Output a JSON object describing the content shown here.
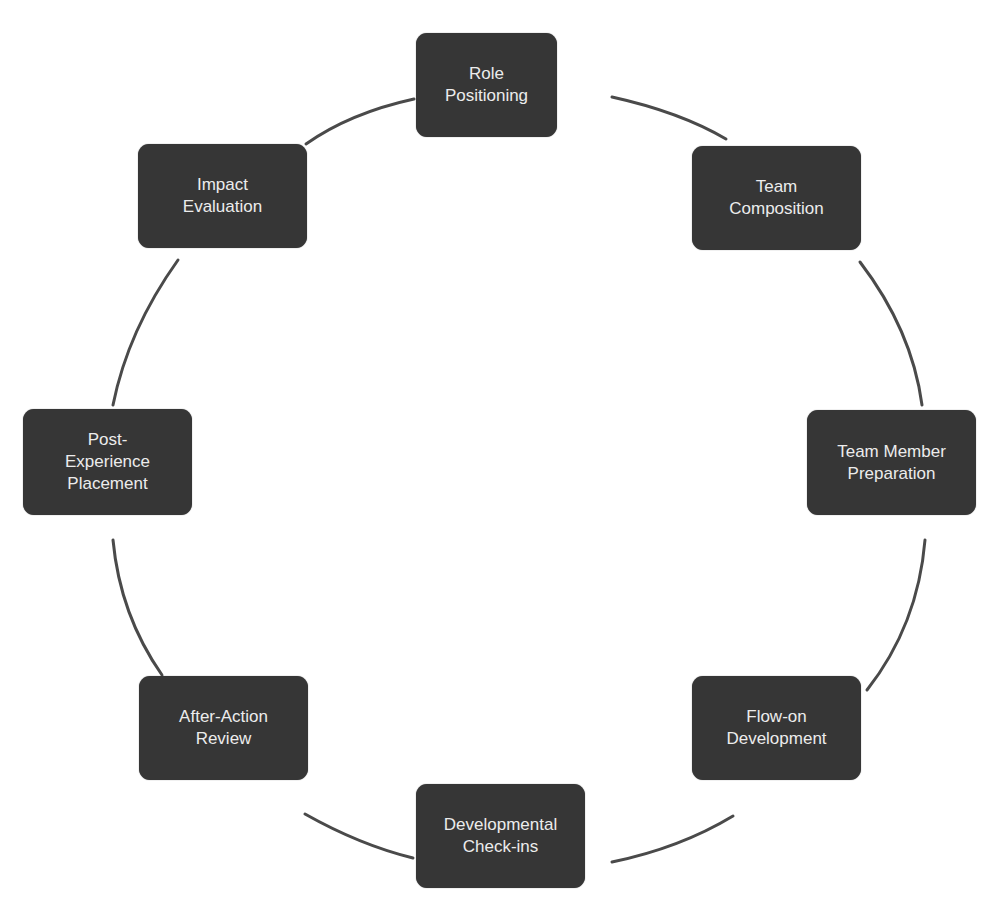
{
  "diagram": {
    "type": "cycle",
    "colors": {
      "node_fill": "#363636",
      "node_text": "#ececec",
      "connector": "#4a4a4a",
      "background": "#ffffff"
    },
    "nodes": [
      {
        "id": "role-positioning",
        "label": "Role\nPositioning"
      },
      {
        "id": "team-composition",
        "label": "Team\nComposition"
      },
      {
        "id": "team-member-preparation",
        "label": "Team Member\nPreparation"
      },
      {
        "id": "flow-on-development",
        "label": "Flow-on\nDevelopment"
      },
      {
        "id": "developmental-check-ins",
        "label": "Developmental\nCheck-ins"
      },
      {
        "id": "after-action-review",
        "label": "After-Action\nReview"
      },
      {
        "id": "post-experience-placement",
        "label": "Post-\nExperience\nPlacement"
      },
      {
        "id": "impact-evaluation",
        "label": "Impact\nEvaluation"
      }
    ],
    "connections": [
      {
        "from": "role-positioning",
        "to": "team-composition"
      },
      {
        "from": "team-composition",
        "to": "team-member-preparation"
      },
      {
        "from": "team-member-preparation",
        "to": "flow-on-development"
      },
      {
        "from": "flow-on-development",
        "to": "developmental-check-ins"
      },
      {
        "from": "developmental-check-ins",
        "to": "after-action-review"
      },
      {
        "from": "after-action-review",
        "to": "post-experience-placement"
      },
      {
        "from": "post-experience-placement",
        "to": "impact-evaluation"
      },
      {
        "from": "impact-evaluation",
        "to": "role-positioning"
      }
    ]
  }
}
